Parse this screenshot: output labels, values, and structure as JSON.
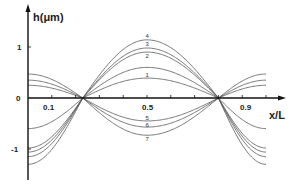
{
  "chart_data": {
    "type": "line",
    "title": "",
    "xlabel": "x/L",
    "ylabel": "h(μm)",
    "xlim": [
      0,
      1
    ],
    "ylim": [
      -1.5,
      1.5
    ],
    "x_tick_labels": [
      {
        "value": 0.1,
        "label": "0.1"
      },
      {
        "value": 0.5,
        "label": "0.5"
      },
      {
        "value": 0.9,
        "label": "0.9"
      }
    ],
    "x_minor_ticks": [
      0.1,
      0.2,
      0.3,
      0.4,
      0.5,
      0.6,
      0.7,
      0.8,
      0.9,
      1.0
    ],
    "y_tick_labels": [
      {
        "value": 1,
        "label": "1"
      },
      {
        "value": 0,
        "label": "0"
      },
      {
        "value": -1,
        "label": "-1"
      }
    ],
    "grid": false,
    "legend": "inline curve labels 1-7 near x/L = 0.5",
    "zero_crossings": [
      0.23,
      0.8
    ],
    "series": [
      {
        "name": "1",
        "h_at_0": -0.6,
        "h_at_0_5": 0.39,
        "h_at_1": -0.6,
        "label_y": 0.45
      },
      {
        "name": "2",
        "h_at_0": 0.25,
        "h_at_0_5": 0.9,
        "h_at_1": 0.25,
        "label_y": 0.82
      },
      {
        "name": "3",
        "h_at_0": 0.35,
        "h_at_0_5": 0.98,
        "h_at_1": 0.35,
        "label_y": 1.05
      },
      {
        "name": "4",
        "h_at_0": 0.47,
        "h_at_0_5": 1.14,
        "h_at_1": 0.47,
        "label_y": 1.22
      },
      {
        "name": "5",
        "h_at_0": -0.98,
        "h_at_0_5": -0.45,
        "h_at_1": -0.98,
        "label_y": -0.39
      },
      {
        "name": "6",
        "h_at_0": -1.06,
        "h_at_0_5": -0.57,
        "h_at_1": -1.06,
        "label_y": -0.53
      },
      {
        "name": "7",
        "h_at_0": -1.3,
        "h_at_0_5": -0.73,
        "h_at_1": -1.3,
        "label_y": -0.8
      }
    ],
    "extra_series_note": "One additional negative-end curve reaching about -1.15 at x/L=0 and 1 (pairs with positive group)"
  },
  "labels": {
    "ylabel": "h(μm)",
    "xlabel": "x/L",
    "y1": "1",
    "y0": "0",
    "ym1": "-1",
    "x01": "0.1",
    "x05": "0.5",
    "x09": "0.9"
  }
}
